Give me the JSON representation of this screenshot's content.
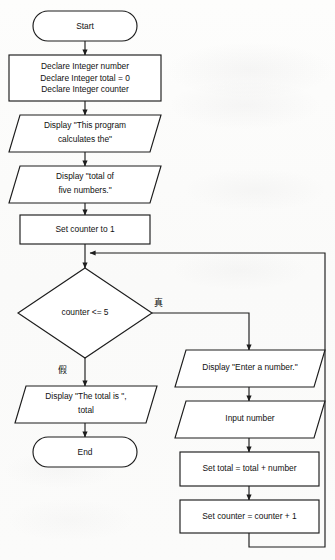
{
  "diagram": {
    "type": "flowchart",
    "colors": {
      "background": "#fcfcfb",
      "stroke": "#1d1d1d",
      "node_fill": "#ffffff",
      "text": "#111111"
    },
    "nodes": [
      {
        "id": "start",
        "shape": "terminator",
        "label": "Start",
        "lines": [
          "Start"
        ]
      },
      {
        "id": "declare",
        "shape": "process",
        "label": "Declare Integer number / Declare Integer total = 0 / Declare Integer counter",
        "lines": [
          "Declare Integer number",
          "Declare Integer total = 0",
          "Declare Integer counter"
        ]
      },
      {
        "id": "display-intro-1",
        "shape": "parallelogram",
        "label": "Display \"This program calculates the\"",
        "lines": [
          "Display \"This program",
          "calculates the\""
        ]
      },
      {
        "id": "display-intro-2",
        "shape": "parallelogram",
        "label": "Display \"total of five numbers.\"",
        "lines": [
          "Display \"total of",
          "five numbers.\""
        ]
      },
      {
        "id": "set-counter-1",
        "shape": "process",
        "label": "Set counter to 1",
        "lines": [
          "Set counter to 1"
        ]
      },
      {
        "id": "decision-counter",
        "shape": "decision",
        "label": "counter <= 5",
        "lines": [
          "counter <= 5"
        ]
      },
      {
        "id": "display-total",
        "shape": "parallelogram",
        "label": "Display \"The total is \", total",
        "lines": [
          "Display \"The total is \",",
          "total"
        ]
      },
      {
        "id": "end",
        "shape": "terminator",
        "label": "End",
        "lines": [
          "End"
        ]
      },
      {
        "id": "display-enter-number",
        "shape": "parallelogram",
        "label": "Display \"Enter a number.\"",
        "lines": [
          "Display \"Enter a number.\""
        ]
      },
      {
        "id": "input-number",
        "shape": "parallelogram",
        "label": "Input number",
        "lines": [
          "Input number"
        ]
      },
      {
        "id": "set-total",
        "shape": "process",
        "label": "Set total = total + number",
        "lines": [
          "Set total = total + number"
        ]
      },
      {
        "id": "set-counter-increment",
        "shape": "process",
        "label": "Set counter = counter + 1",
        "lines": [
          "Set counter = counter + 1"
        ]
      }
    ],
    "branch_labels": {
      "true": "真",
      "false": "假"
    },
    "edges": [
      {
        "from": "start",
        "to": "declare",
        "label": ""
      },
      {
        "from": "declare",
        "to": "display-intro-1",
        "label": ""
      },
      {
        "from": "display-intro-1",
        "to": "display-intro-2",
        "label": ""
      },
      {
        "from": "display-intro-2",
        "to": "set-counter-1",
        "label": ""
      },
      {
        "from": "set-counter-1",
        "to": "decision-counter",
        "label": ""
      },
      {
        "from": "decision-counter",
        "to": "display-enter-number",
        "label": "真"
      },
      {
        "from": "decision-counter",
        "to": "display-total",
        "label": "假"
      },
      {
        "from": "display-total",
        "to": "end",
        "label": ""
      },
      {
        "from": "display-enter-number",
        "to": "input-number",
        "label": ""
      },
      {
        "from": "input-number",
        "to": "set-total",
        "label": ""
      },
      {
        "from": "set-total",
        "to": "set-counter-increment",
        "label": ""
      },
      {
        "from": "set-counter-increment",
        "to": "decision-counter",
        "label": ""
      }
    ]
  }
}
